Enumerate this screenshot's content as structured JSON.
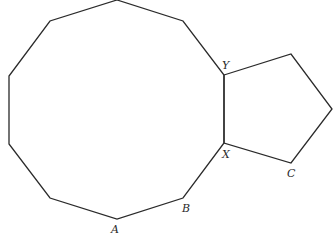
{
  "diagram": {
    "decagon": {
      "points": [
        [
          117,
          0
        ],
        [
          183,
          21
        ],
        [
          224,
          75
        ],
        [
          224,
          143
        ],
        [
          183,
          198
        ],
        [
          117,
          219
        ],
        [
          50,
          198
        ],
        [
          9,
          144
        ],
        [
          9,
          76
        ],
        [
          50,
          21
        ]
      ]
    },
    "pentagon": {
      "points": [
        [
          224,
          75
        ],
        [
          291,
          54
        ],
        [
          332,
          109
        ],
        [
          291,
          163
        ],
        [
          224,
          143
        ]
      ]
    },
    "labels": [
      {
        "id": "Y",
        "text": "Y",
        "x": 222,
        "y": 69
      },
      {
        "id": "X",
        "text": "X",
        "x": 222,
        "y": 158
      },
      {
        "id": "C",
        "text": "C",
        "x": 287,
        "y": 177
      },
      {
        "id": "B",
        "text": "B",
        "x": 182,
        "y": 212
      },
      {
        "id": "A",
        "text": "A",
        "x": 111,
        "y": 233
      }
    ]
  }
}
